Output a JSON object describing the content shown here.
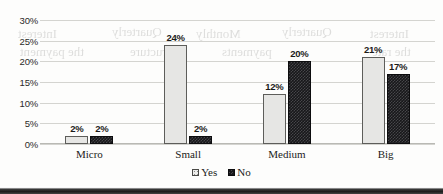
{
  "chart_data": {
    "type": "bar",
    "title": "",
    "subtitle": "",
    "xlabel": "",
    "ylabel": "",
    "categories": [
      "Micro",
      "Small",
      "Medium",
      "Big"
    ],
    "series": [
      {
        "name": "Yes",
        "values": [
          2,
          24,
          12,
          21
        ],
        "pattern": "dotted-light",
        "color": "#e6e6e4"
      },
      {
        "name": "No",
        "values": [
          2,
          2,
          20,
          17
        ],
        "pattern": "checkered-dark",
        "color": "#17171a"
      }
    ],
    "value_labels": [
      [
        "2%",
        "24%",
        "12%",
        "21%"
      ],
      [
        "2%",
        "2%",
        "20%",
        "17%"
      ]
    ],
    "ylim": [
      0,
      30
    ],
    "ytick_values": [
      0,
      5,
      10,
      15,
      20,
      25,
      30
    ],
    "ytick_labels": [
      "0%",
      "5%",
      "10%",
      "15%",
      "20%",
      "25%",
      "30%"
    ],
    "grid": true,
    "grid_axis": "y",
    "legend_position": "bottom",
    "units": "percent"
  },
  "axis": {
    "y": {
      "ticks": [
        {
          "label": "30%",
          "value": 30
        },
        {
          "label": "25%",
          "value": 25
        },
        {
          "label": "20%",
          "value": 20
        },
        {
          "label": "15%",
          "value": 15
        },
        {
          "label": "10%",
          "value": 10
        },
        {
          "label": "5%",
          "value": 5
        },
        {
          "label": "0%",
          "value": 0
        }
      ]
    },
    "x": {
      "categories": [
        {
          "label": "Micro"
        },
        {
          "label": "Small"
        },
        {
          "label": "Medium"
        },
        {
          "label": "Big"
        }
      ]
    }
  },
  "legend": {
    "items": [
      {
        "label": "Yes",
        "swatch": "legend-swatch-yes"
      },
      {
        "label": "No",
        "swatch": "legend-swatch-no"
      }
    ]
  },
  "ghost_text": [
    {
      "text": "Interest",
      "x": 18,
      "y": 26,
      "size": 13
    },
    {
      "text": "Quarterly",
      "x": 112,
      "y": 24,
      "size": 13
    },
    {
      "text": "Monthly",
      "x": 196,
      "y": 26,
      "size": 13
    },
    {
      "text": "Quarterly",
      "x": 282,
      "y": 24,
      "size": 13
    },
    {
      "text": "Interest",
      "x": 370,
      "y": 26,
      "size": 13
    },
    {
      "text": "the payment",
      "x": 20,
      "y": 44,
      "size": 13
    },
    {
      "text": "structure",
      "x": 130,
      "y": 44,
      "size": 13
    },
    {
      "text": "payments",
      "x": 222,
      "y": 44,
      "size": 13
    },
    {
      "text": "the rate",
      "x": 372,
      "y": 44,
      "size": 13
    }
  ]
}
